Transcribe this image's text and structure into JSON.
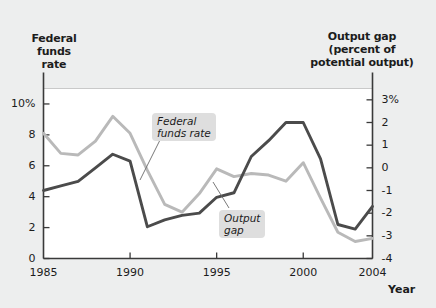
{
  "titles": {
    "left_axis_title": "Federal\nfunds\nrate",
    "left_axis_title_l1": "Federal",
    "left_axis_title_l2": "funds",
    "left_axis_title_l3": "rate",
    "right_axis_title_l1": "Output gap",
    "right_axis_title_l2": "(percent of",
    "right_axis_title_l3": "potential output)",
    "x_axis_title": "Year"
  },
  "callouts": {
    "federal_funds_l1": "Federal",
    "federal_funds_l2": "funds rate",
    "output_gap_l1": "Output",
    "output_gap_l2": "gap"
  },
  "axis_labels": {
    "left": [
      "10%",
      "8",
      "6",
      "4",
      "2",
      "0"
    ],
    "right": [
      "3%",
      "2",
      "1",
      "0",
      "-1",
      "-2",
      "-3",
      "-4"
    ],
    "x": [
      "1985",
      "1990",
      "1995",
      "2000",
      "2004"
    ]
  },
  "colors": {
    "background": "#edeeee",
    "plot_background": "#ffffff",
    "federal_funds_line": "#b9b9b9",
    "output_gap_line": "#4b4b4b",
    "axis": "#3a3a3a",
    "callout_background": "#dedede",
    "text": "#1c1c1c"
  },
  "chart_data": {
    "type": "line",
    "xlabel": "Year",
    "grid": false,
    "legend": "annotations-inline",
    "x": [
      1985,
      1986,
      1987,
      1988,
      1989,
      1990,
      1991,
      1992,
      1993,
      1994,
      1995,
      1996,
      1997,
      1998,
      1999,
      2000,
      2001,
      2002,
      2003,
      2004
    ],
    "xlim": [
      1985,
      2004
    ],
    "xticks": [
      1985,
      1990,
      1995,
      2000,
      2004
    ],
    "axes": [
      {
        "id": "left",
        "label": "Federal funds rate",
        "ylim": [
          0,
          11
        ],
        "yticks": [
          0,
          2,
          4,
          6,
          8,
          10
        ],
        "ytick_labels": [
          "0",
          "2",
          "4",
          "6",
          "8",
          "10%"
        ]
      },
      {
        "id": "right",
        "label": "Output gap (percent of potential output)",
        "ylim": [
          -4,
          3.5
        ],
        "yticks": [
          -4,
          -3,
          -2,
          -1,
          0,
          1,
          2,
          3
        ],
        "ytick_labels": [
          "-4",
          "-3",
          "-2",
          "-1",
          "0",
          "1",
          "2",
          "3%"
        ]
      }
    ],
    "series": [
      {
        "name": "Federal funds rate",
        "axis": "left",
        "color": "#b9b9b9",
        "values": [
          8.1,
          6.8,
          6.7,
          7.6,
          9.2,
          8.1,
          5.7,
          3.5,
          3.0,
          4.2,
          5.8,
          5.3,
          5.5,
          5.4,
          5.0,
          6.2,
          3.9,
          1.7,
          1.1,
          1.3
        ]
      },
      {
        "name": "Output gap",
        "axis": "right",
        "color": "#4b4b4b",
        "values": [
          -1.0,
          -0.8,
          -0.6,
          0.0,
          0.6,
          0.3,
          -2.6,
          -2.3,
          -2.1,
          -2.0,
          -1.3,
          -1.1,
          0.5,
          1.2,
          2.0,
          2.0,
          0.4,
          -2.5,
          -2.7,
          -1.7
        ]
      }
    ]
  }
}
